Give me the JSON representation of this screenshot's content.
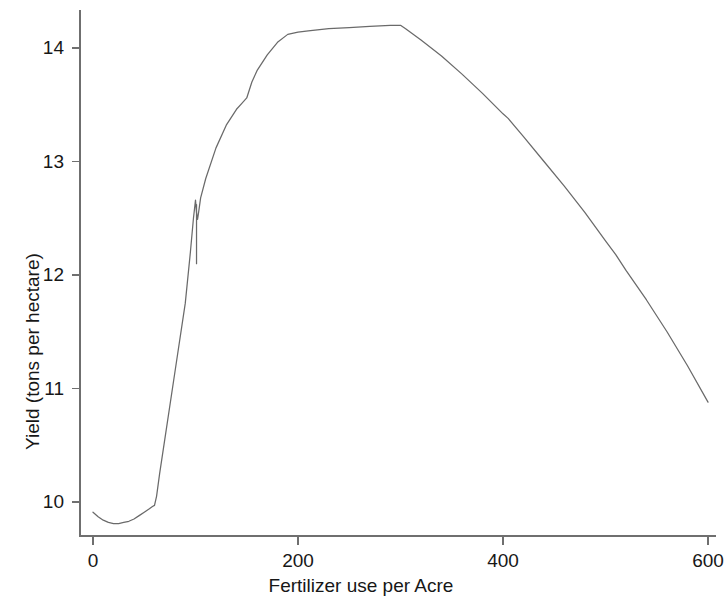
{
  "chart_data": {
    "type": "line",
    "title": "",
    "xlabel": "Fertilizer use per Acre",
    "ylabel": "Yield (tons per hectare)",
    "xlim": [
      0,
      600
    ],
    "ylim": [
      9.7,
      14.45
    ],
    "xticks": [
      0,
      200,
      400,
      600
    ],
    "xtick_labels": [
      "0",
      "200",
      "400",
      "600"
    ],
    "yticks": [
      10,
      11,
      12,
      13,
      14
    ],
    "ytick_labels": [
      "10",
      "11",
      "12",
      "13",
      "14"
    ],
    "grid": false,
    "legend": false,
    "series": [
      {
        "name": "Yield",
        "color": "#6a6a6a",
        "x": [
          0,
          5,
          10,
          15,
          20,
          25,
          30,
          35,
          40,
          45,
          50,
          55,
          58,
          60,
          62,
          65,
          70,
          80,
          90,
          95,
          98,
          100,
          101,
          102,
          103,
          105,
          110,
          120,
          130,
          140,
          145,
          150,
          155,
          160,
          170,
          180,
          190,
          200,
          210,
          230,
          250,
          270,
          290,
          300,
          305,
          320,
          340,
          360,
          380,
          400,
          405,
          420,
          440,
          460,
          480,
          500,
          510,
          520,
          540,
          560,
          580,
          600
        ],
        "y": [
          9.91,
          9.87,
          9.84,
          9.82,
          9.81,
          9.81,
          9.82,
          9.83,
          9.85,
          9.88,
          9.91,
          9.94,
          9.96,
          9.97,
          10.05,
          10.25,
          10.55,
          11.15,
          11.75,
          12.2,
          12.5,
          12.66,
          12.55,
          12.49,
          12.55,
          12.68,
          12.85,
          13.12,
          13.32,
          13.46,
          13.51,
          13.56,
          13.7,
          13.8,
          13.94,
          14.05,
          14.12,
          14.14,
          14.15,
          14.17,
          14.18,
          14.19,
          14.2,
          14.2,
          14.17,
          14.07,
          13.93,
          13.77,
          13.6,
          13.42,
          13.38,
          13.22,
          13.0,
          12.78,
          12.55,
          12.3,
          12.18,
          12.04,
          11.78,
          11.5,
          11.2,
          10.88
        ]
      }
    ],
    "annotations": [
      {
        "name": "dip-minimum",
        "x": 20,
        "y": 9.81
      },
      {
        "name": "notch-drop",
        "x": 101,
        "y": 12.1
      },
      {
        "name": "plateau-start",
        "x": 200,
        "y": 14.14
      },
      {
        "name": "plateau-peak",
        "x": 300,
        "y": 14.2
      },
      {
        "name": "slope-break",
        "x": 400,
        "y": 13.42
      },
      {
        "name": "endpoint",
        "x": 600,
        "y": 10.88
      }
    ],
    "axis_color": "#6f6f6f"
  },
  "axes": {
    "x_title": "Fertilizer use per Acre",
    "y_title": "Yield (tons per hectare)"
  }
}
